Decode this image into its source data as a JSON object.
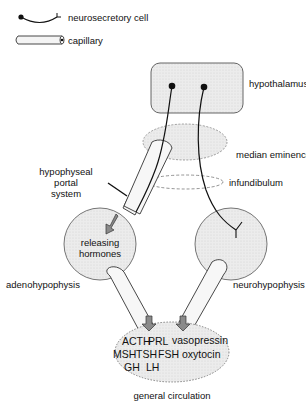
{
  "legend": {
    "neurosecretory_cell": "neurosecretory cell",
    "capillary": "capillary"
  },
  "labels": {
    "hypothalamus": "hypothalamus",
    "median_eminence": "median eminence",
    "portal_line1": "hypophyseal",
    "portal_line2": "portal",
    "portal_line3": "system",
    "infundibulum": "infundibulum",
    "releasing_line1": "releasing",
    "releasing_line2": "hormones",
    "adenohypophysis": "adenohypophysis",
    "neurohypophysis": "neurohypophysis",
    "general_circulation": "general circulation"
  },
  "hormones": {
    "anterior": [
      "ACTH",
      "PRL",
      "MSH",
      "TSH",
      "FSH",
      "GH",
      "LH"
    ],
    "posterior": [
      "vasopressin",
      "oxytocin"
    ]
  },
  "colors": {
    "fill": "#e6e6e6",
    "stroke": "#222222",
    "arrow": "#8a8a8a"
  }
}
